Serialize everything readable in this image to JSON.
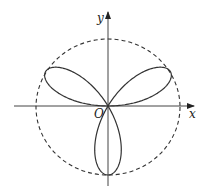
{
  "chart_data": {
    "type": "polar_curve",
    "curve": "r = a sin(3θ)",
    "petals": 3,
    "petal_directions_deg": [
      30,
      150,
      270
    ],
    "bounding_circle": {
      "style": "dashed",
      "radius": "a"
    },
    "axes": {
      "x_label": "x",
      "y_label": "y",
      "origin_label": "O"
    }
  },
  "labels": {
    "x": "x",
    "y": "y",
    "origin": "O"
  },
  "colors": {
    "stroke": "#333333",
    "background": "#ffffff"
  }
}
